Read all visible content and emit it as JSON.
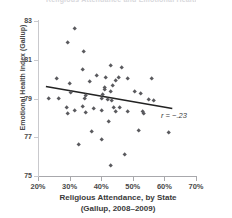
{
  "chart_data": {
    "type": "scatter",
    "title": "Religious Attendance and Emotional Health",
    "xlabel_line1": "Religious Attendance, by State",
    "xlabel_line2": "(Gallup, 2008–2009)",
    "ylabel": "Emotional Health Index (Gallup)",
    "xlim": [
      20,
      70
    ],
    "ylim": [
      75,
      83
    ],
    "xticks": [
      "20%",
      "30%",
      "40%",
      "50%",
      "60%",
      "70%"
    ],
    "xtick_values": [
      20,
      30,
      40,
      50,
      60,
      70
    ],
    "yticks": [
      "83",
      "81",
      "79",
      "77",
      "75"
    ],
    "ytick_values": [
      83,
      81,
      79,
      77,
      75
    ],
    "grid": false,
    "legend": "none",
    "marker_shape": "diamond",
    "marker_color": "#5a5a5e",
    "trendline_color": "#222222",
    "annotation": "r = −.23",
    "correlation": -0.23,
    "trendline": {
      "x0": 22.5,
      "y0": 79.62,
      "x1": 62.5,
      "y1": 78.48
    },
    "points": [
      {
        "x": 31.5,
        "y": 82.6
      },
      {
        "x": 29.5,
        "y": 81.9
      },
      {
        "x": 34.5,
        "y": 81.4
      },
      {
        "x": 34.0,
        "y": 80.5
      },
      {
        "x": 43.0,
        "y": 80.7
      },
      {
        "x": 46.5,
        "y": 80.6
      },
      {
        "x": 38.5,
        "y": 80.2
      },
      {
        "x": 41.5,
        "y": 80.1
      },
      {
        "x": 45.5,
        "y": 80.1
      },
      {
        "x": 48.5,
        "y": 80.0
      },
      {
        "x": 56.0,
        "y": 80.0
      },
      {
        "x": 26.0,
        "y": 80.0
      },
      {
        "x": 36.5,
        "y": 79.85
      },
      {
        "x": 30.0,
        "y": 79.75
      },
      {
        "x": 43.5,
        "y": 79.65
      },
      {
        "x": 44.5,
        "y": 79.9
      },
      {
        "x": 41.0,
        "y": 79.55
      },
      {
        "x": 41.2,
        "y": 79.45
      },
      {
        "x": 30.5,
        "y": 79.3
      },
      {
        "x": 35.0,
        "y": 79.15
      },
      {
        "x": 40.5,
        "y": 79.2
      },
      {
        "x": 43.0,
        "y": 79.35
      },
      {
        "x": 50.5,
        "y": 79.35
      },
      {
        "x": 52.5,
        "y": 79.25
      },
      {
        "x": 23.5,
        "y": 79.0
      },
      {
        "x": 26.5,
        "y": 79.0
      },
      {
        "x": 34.8,
        "y": 79.0
      },
      {
        "x": 40.0,
        "y": 79.0
      },
      {
        "x": 42.0,
        "y": 78.95
      },
      {
        "x": 43.2,
        "y": 78.9
      },
      {
        "x": 55.0,
        "y": 78.95
      },
      {
        "x": 56.5,
        "y": 78.9
      },
      {
        "x": 29.0,
        "y": 78.55
      },
      {
        "x": 34.0,
        "y": 78.6
      },
      {
        "x": 37.5,
        "y": 78.5
      },
      {
        "x": 44.0,
        "y": 78.55
      },
      {
        "x": 46.0,
        "y": 78.55
      },
      {
        "x": 31.5,
        "y": 78.35
      },
      {
        "x": 29.5,
        "y": 78.2
      },
      {
        "x": 35.0,
        "y": 78.25
      },
      {
        "x": 40.2,
        "y": 78.35
      },
      {
        "x": 44.5,
        "y": 78.3
      },
      {
        "x": 48.5,
        "y": 78.3
      },
      {
        "x": 53.0,
        "y": 78.3
      },
      {
        "x": 53.5,
        "y": 78.2
      },
      {
        "x": 42.5,
        "y": 77.8
      },
      {
        "x": 37.0,
        "y": 77.3
      },
      {
        "x": 52.0,
        "y": 77.35
      },
      {
        "x": 61.5,
        "y": 77.25
      },
      {
        "x": 40.0,
        "y": 76.9
      },
      {
        "x": 33.0,
        "y": 76.6
      },
      {
        "x": 47.5,
        "y": 76.1
      },
      {
        "x": 43.0,
        "y": 75.55
      }
    ]
  }
}
